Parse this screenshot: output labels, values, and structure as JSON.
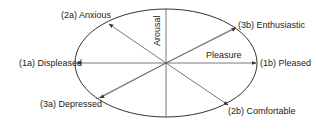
{
  "diagram": {
    "axes": {
      "vertical": "Arousal",
      "horizontal": "Pleasure"
    },
    "labels": [
      {
        "id": "1a",
        "text": "(1a) Displeased"
      },
      {
        "id": "1b",
        "text": "(1b) Pleased"
      },
      {
        "id": "2a",
        "text": "(2a) Anxious"
      },
      {
        "id": "2b",
        "text": "(2b) Comfortable"
      },
      {
        "id": "3a",
        "text": "(3a) Depressed"
      },
      {
        "id": "3b",
        "text": "(3b) Enthusiastic"
      }
    ],
    "line_color": "#333333"
  }
}
